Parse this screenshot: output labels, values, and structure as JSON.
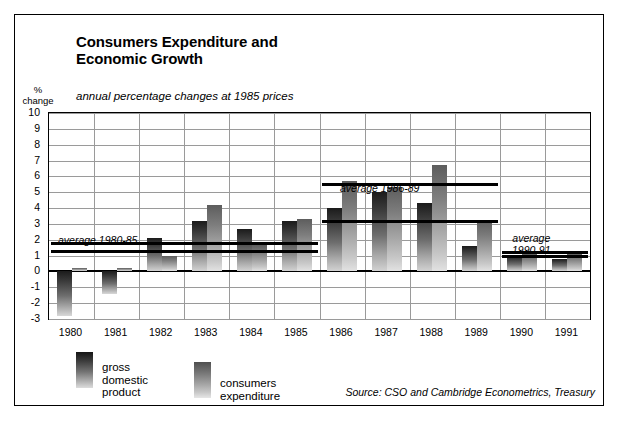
{
  "title": {
    "line1": "Consumers Expenditure and",
    "line2": "Economic Growth"
  },
  "subtitle": "annual percentage changes at 1985 prices",
  "axis_label": {
    "line1": "%",
    "line2": "change"
  },
  "source": "Source: CSO and Cambridge Econometrics, Treasury",
  "legend": [
    {
      "name": "gross-domestic-product",
      "line1": "gross",
      "line2": "domestic",
      "line3": "product"
    },
    {
      "name": "consumers-expenditure",
      "line1": "consumers",
      "line2": "expenditure",
      "line3": ""
    }
  ],
  "annotations": [
    {
      "name": "average-1980-85",
      "line1": "average 1980-85",
      "line2": ""
    },
    {
      "name": "average-1986-89",
      "line1": "average 1986-89",
      "line2": ""
    },
    {
      "name": "average-1990-91",
      "line1": "average",
      "line2": "1990-91"
    }
  ],
  "chart_data": {
    "type": "bar",
    "title": "Consumers Expenditure and Economic Growth",
    "subtitle": "annual percentage changes at 1985 prices",
    "xlabel": "",
    "ylabel": "% change",
    "ylim": [
      -3,
      10
    ],
    "yticks": [
      10,
      9,
      8,
      7,
      6,
      5,
      4,
      3,
      2,
      1,
      0,
      -1,
      -2,
      -3
    ],
    "grid": true,
    "legend_position": "below-left",
    "categories": [
      "1980",
      "1981",
      "1982",
      "1983",
      "1984",
      "1985",
      "1986",
      "1987",
      "1988",
      "1989",
      "1990",
      "1991"
    ],
    "series": [
      {
        "name": "gross domestic product",
        "values": [
          -2.8,
          -1.4,
          2.1,
          3.2,
          2.7,
          3.2,
          4.0,
          5.0,
          4.3,
          1.6,
          1.0,
          0.8
        ]
      },
      {
        "name": "consumers expenditure",
        "values": [
          0.2,
          0.2,
          1.0,
          4.2,
          1.7,
          3.3,
          5.7,
          5.3,
          6.7,
          3.2,
          1.1,
          1.1
        ]
      }
    ],
    "reference_lines": [
      {
        "label": "average 1980-85",
        "series": "gross domestic product",
        "value": 1.8,
        "span": [
          "1980",
          "1985"
        ]
      },
      {
        "label": "average 1980-85",
        "series": "consumers expenditure",
        "value": 1.3,
        "span": [
          "1980",
          "1985"
        ]
      },
      {
        "label": "average 1986-89",
        "series": "consumers expenditure",
        "value": 5.5,
        "span": [
          "1986",
          "1989"
        ]
      },
      {
        "label": "average 1986-89",
        "series": "gross domestic product",
        "value": 3.2,
        "span": [
          "1986",
          "1989"
        ]
      },
      {
        "label": "average 1990-91",
        "series": "consumers expenditure",
        "value": 1.2,
        "span": [
          "1990",
          "1991"
        ]
      },
      {
        "label": "average 1990-91",
        "series": "gross domestic product",
        "value": 1.0,
        "span": [
          "1990",
          "1991"
        ]
      }
    ]
  }
}
